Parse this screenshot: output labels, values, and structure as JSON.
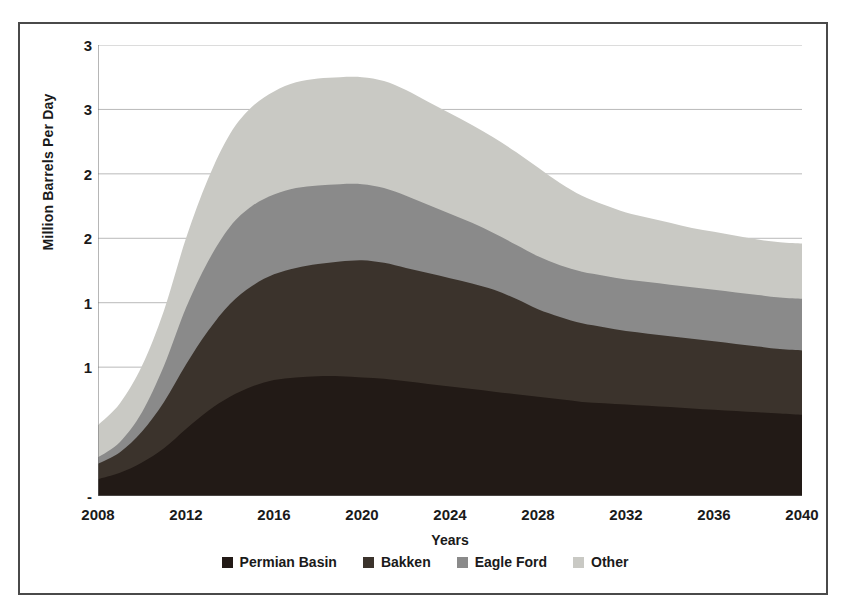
{
  "chart_data": {
    "type": "area",
    "stacked": true,
    "title": "",
    "xlabel": "Years",
    "ylabel": "Million Barrels Per Day",
    "xlim": [
      2008,
      2040
    ],
    "ylim": [
      0,
      3.5
    ],
    "xtick_step": 4,
    "ytick_step": 0.5,
    "grid": true,
    "grid_axis": "y",
    "legend_position": "bottom",
    "minor_x_ticks": true,
    "x": [
      2008,
      2009,
      2010,
      2011,
      2012,
      2013,
      2014,
      2015,
      2016,
      2017,
      2018,
      2019,
      2020,
      2021,
      2022,
      2023,
      2024,
      2025,
      2026,
      2027,
      2028,
      2029,
      2030,
      2031,
      2032,
      2033,
      2034,
      2035,
      2036,
      2037,
      2038,
      2039,
      2040
    ],
    "xticks": [
      2008,
      2012,
      2016,
      2020,
      2024,
      2028,
      2032,
      2036,
      2040
    ],
    "xtick_labels": [
      "2008",
      "2012",
      "2016",
      "2020",
      "2024",
      "2028",
      "2032",
      "2036",
      "2040"
    ],
    "yticks": [
      3.5,
      3.0,
      2.5,
      2.0,
      1.5,
      1.0,
      0.5,
      0.0
    ],
    "ytick_labels": [
      "3",
      "3",
      "2",
      "2",
      "1",
      "1",
      "-"
    ],
    "ytick_values_shown": [
      3.5,
      3.0,
      2.5,
      2.0,
      1.5,
      1.0,
      0.0
    ],
    "series": [
      {
        "name": "Permian Basin",
        "color": "#221a16",
        "values": [
          0.13,
          0.18,
          0.26,
          0.37,
          0.52,
          0.66,
          0.77,
          0.85,
          0.9,
          0.92,
          0.93,
          0.93,
          0.92,
          0.91,
          0.89,
          0.87,
          0.85,
          0.83,
          0.81,
          0.79,
          0.77,
          0.75,
          0.73,
          0.72,
          0.71,
          0.7,
          0.69,
          0.68,
          0.67,
          0.66,
          0.65,
          0.64,
          0.63
        ]
      },
      {
        "name": "Bakken",
        "color": "#3b332c",
        "values": [
          0.12,
          0.16,
          0.24,
          0.36,
          0.5,
          0.62,
          0.72,
          0.78,
          0.82,
          0.85,
          0.87,
          0.89,
          0.91,
          0.9,
          0.88,
          0.86,
          0.84,
          0.82,
          0.79,
          0.74,
          0.68,
          0.64,
          0.61,
          0.59,
          0.57,
          0.56,
          0.55,
          0.54,
          0.53,
          0.52,
          0.51,
          0.5,
          0.5
        ]
      },
      {
        "name": "Eagle Ford",
        "color": "#8a8a8a",
        "values": [
          0.05,
          0.08,
          0.15,
          0.28,
          0.44,
          0.54,
          0.6,
          0.62,
          0.62,
          0.62,
          0.61,
          0.6,
          0.59,
          0.58,
          0.56,
          0.53,
          0.5,
          0.47,
          0.44,
          0.42,
          0.41,
          0.4,
          0.4,
          0.4,
          0.4,
          0.4,
          0.4,
          0.4,
          0.4,
          0.4,
          0.4,
          0.4,
          0.4
        ]
      },
      {
        "name": "Other",
        "color": "#c9c9c4",
        "values": [
          0.25,
          0.3,
          0.36,
          0.43,
          0.54,
          0.64,
          0.72,
          0.77,
          0.8,
          0.82,
          0.83,
          0.83,
          0.83,
          0.83,
          0.82,
          0.8,
          0.78,
          0.76,
          0.74,
          0.72,
          0.69,
          0.64,
          0.59,
          0.55,
          0.52,
          0.5,
          0.48,
          0.46,
          0.45,
          0.44,
          0.43,
          0.43,
          0.43
        ]
      }
    ]
  },
  "legend": {
    "items": [
      {
        "label": "Permian Basin",
        "color": "#221a16"
      },
      {
        "label": "Bakken",
        "color": "#3b332c"
      },
      {
        "label": "Eagle Ford",
        "color": "#8a8a8a"
      },
      {
        "label": "Other",
        "color": "#c9c9c4"
      }
    ]
  },
  "axes": {
    "y_title": "Million Barrels Per Day",
    "x_title": "Years"
  }
}
